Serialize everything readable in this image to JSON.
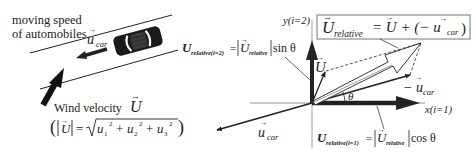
{
  "diagram": {
    "left_panel": {
      "road_label_line1": "moving speed",
      "road_label_line2": "of automobiles",
      "car_velocity_label": "u",
      "car_velocity_subscript": "car",
      "wind_label": "Wind velocity",
      "wind_symbol": "U",
      "magnitude_formula": {
        "lhs": "|U| =",
        "radical": "√",
        "terms": [
          "u",
          "1",
          "2",
          "+",
          "u",
          "2",
          "2",
          "+",
          "u",
          "3",
          "2"
        ]
      }
    },
    "right_panel": {
      "y_axis_label": "y(i=2)",
      "x_axis_label": "x(i=1)",
      "boxed_equation": {
        "lhs": "U",
        "lhs_subscript": "relative",
        "rhs": "= U + (− u",
        "rhs_subscript": "car",
        "close": ")"
      },
      "y_component_label": {
        "symbol": "U",
        "subscript": "relative(i=2)",
        "equals": "=",
        "abs_symbol": "U",
        "abs_subscript": "relative",
        "trig": "sin θ"
      },
      "x_component_label": {
        "symbol": "U",
        "subscript": "relative(i=1)",
        "equals": "=",
        "abs_symbol": "U",
        "abs_subscript": "relative",
        "trig": "cos θ"
      },
      "wind_vector_label": "U",
      "neg_car_vector_label": "− u",
      "neg_car_vector_subscript": "car",
      "car_vector_label": "u",
      "car_vector_subscript": "car",
      "angle_label": "θ"
    },
    "colors": {
      "ink": "#222222",
      "axis": "#555555",
      "frame": "#777777",
      "background": "#ffffff"
    }
  }
}
